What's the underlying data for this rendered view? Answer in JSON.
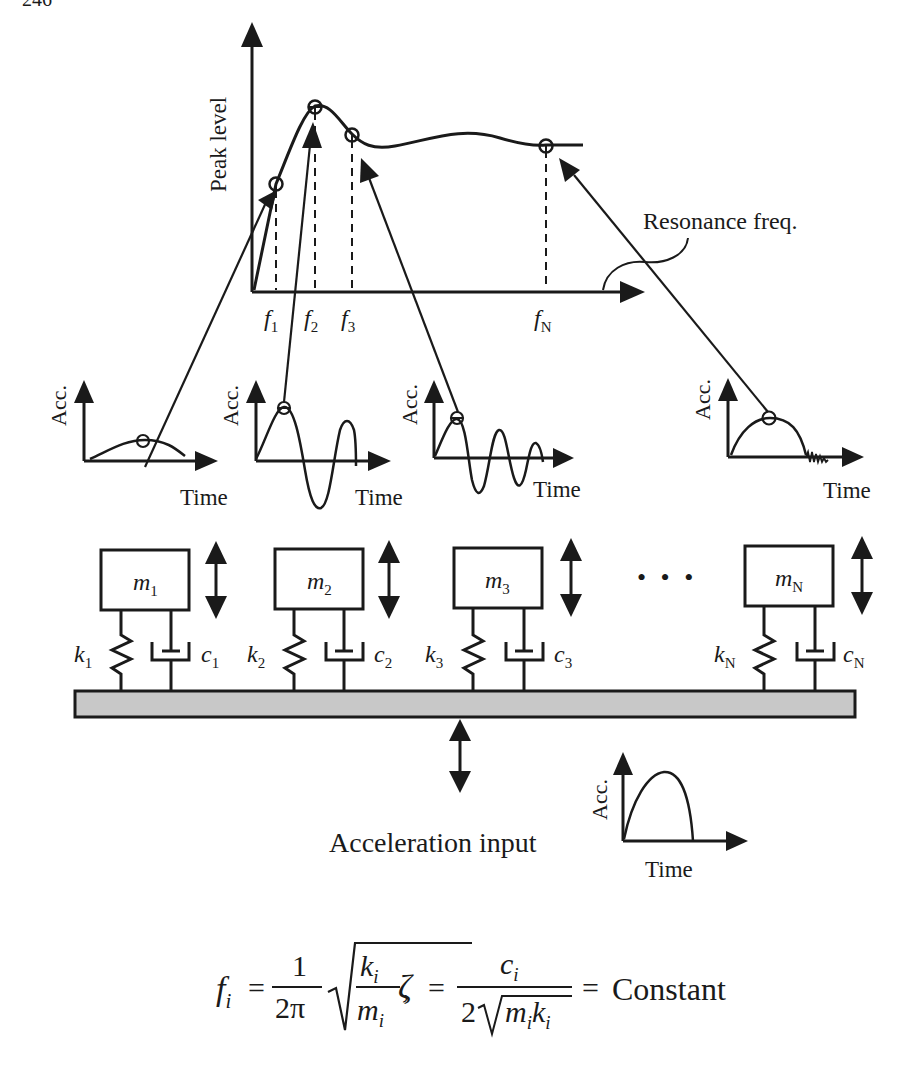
{
  "page_number": "246",
  "spectrum": {
    "y_label": "Peak level",
    "x_ticks": [
      "f",
      "f",
      "f",
      "f"
    ],
    "x_tick_subs": [
      "1",
      "2",
      "3",
      "N"
    ],
    "annotation": "Resonance freq."
  },
  "responses": [
    {
      "y_label": "Acc.",
      "x_label": "Time"
    },
    {
      "y_label": "Acc.",
      "x_label": "Time"
    },
    {
      "y_label": "Acc.",
      "x_label": "Time"
    },
    {
      "y_label": "Acc.",
      "x_label": "Time"
    }
  ],
  "oscillators": [
    {
      "mass": "m",
      "mass_sub": "1",
      "spring": "k",
      "spring_sub": "1",
      "damper": "c",
      "damper_sub": "1"
    },
    {
      "mass": "m",
      "mass_sub": "2",
      "spring": "k",
      "spring_sub": "2",
      "damper": "c",
      "damper_sub": "2"
    },
    {
      "mass": "m",
      "mass_sub": "3",
      "spring": "k",
      "spring_sub": "3",
      "damper": "c",
      "damper_sub": "3"
    },
    {
      "mass": "m",
      "mass_sub": "N",
      "spring": "k",
      "spring_sub": "N",
      "damper": "c",
      "damper_sub": "N"
    }
  ],
  "ellipsis": "• • •",
  "input": {
    "label": "Acceleration input",
    "y_label": "Acc.",
    "x_label": "Time"
  },
  "formula": {
    "f": "f",
    "i": "i",
    "eq": "=",
    "one": "1",
    "two_pi": "2π",
    "k": "k",
    "m": "m",
    "comma": ",",
    "zeta": "ζ",
    "c": "c",
    "two": "2",
    "constant": "Constant"
  },
  "colors": {
    "ink": "#1a1a1a",
    "base_fill": "#c8c8c8"
  }
}
